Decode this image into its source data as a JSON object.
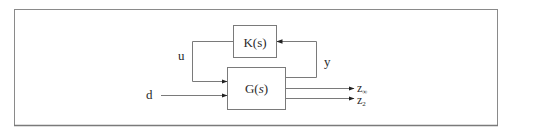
{
  "diagram": {
    "type": "control-block-diagram",
    "blocks": [
      {
        "id": "K",
        "label": "K(s)",
        "label_prefix": "K(",
        "label_var": "s",
        "label_suffix": ")"
      },
      {
        "id": "G",
        "label": "G(s)",
        "label_prefix": "G(",
        "label_var": "s",
        "label_suffix": ")"
      }
    ],
    "signals": {
      "u": "u",
      "y": "y",
      "d": "d",
      "z_inf": "z",
      "z_inf_sub": "∞",
      "z_2": "z",
      "z_2_sub": "2"
    },
    "edges": [
      {
        "from": "K",
        "to": "G",
        "label": "u"
      },
      {
        "from": "G",
        "to": "K",
        "label": "y"
      },
      {
        "from": "input",
        "to": "G",
        "label": "d"
      },
      {
        "from": "G",
        "to": "output",
        "label": "z∞"
      },
      {
        "from": "G",
        "to": "output",
        "label": "z2"
      }
    ],
    "colors": {
      "frame": "#8a8a8a",
      "line": "#7a7a7a",
      "text": "#2a2a2a"
    }
  }
}
